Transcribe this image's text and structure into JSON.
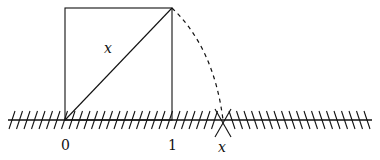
{
  "diagram": {
    "title": "",
    "colors": {
      "stroke": "#111111",
      "background": "#ffffff"
    },
    "labels": {
      "diagonal": "x",
      "origin": "0",
      "one": "1",
      "point_x": "x"
    },
    "geometry": {
      "origin_px": [
        65,
        120
      ],
      "unit_px": 107,
      "square": {
        "left": 65,
        "right": 172,
        "top": 8,
        "bottom": 120
      },
      "arc": {
        "center": [
          65,
          120
        ],
        "radius": 158,
        "style": "dashed"
      },
      "number_line": {
        "x_start": 8,
        "x_end": 372,
        "y": 120,
        "hatched": true
      },
      "mark_x": 223
    }
  }
}
